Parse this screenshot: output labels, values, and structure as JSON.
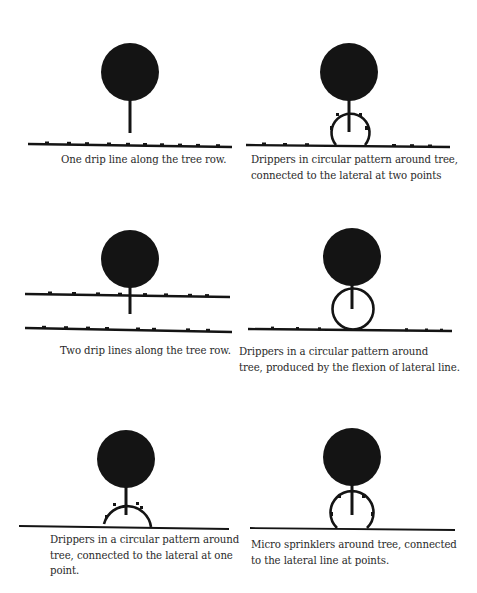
{
  "figure": {
    "colors": {
      "ink": "#141414",
      "caption": "#2a2a2a",
      "background": "#ffffff"
    },
    "panels": [
      {
        "id": "one-drip-line",
        "caption_lines": [
          "One drip line along the tree row."
        ]
      },
      {
        "id": "circular-two-points",
        "caption_lines": [
          "Drippers in circular pattern around tree,",
          "connected to the lateral at two points"
        ]
      },
      {
        "id": "two-drip-lines",
        "caption_lines": [
          "Two drip lines along the tree row."
        ]
      },
      {
        "id": "circular-flexion",
        "caption_lines": [
          "Drippers in a circular pattern around",
          "tree, produced by the flexion of lateral line."
        ]
      },
      {
        "id": "circular-one-point",
        "caption_lines": [
          "Drippers in a circular pattern around",
          "tree, connected to the lateral at one",
          "point."
        ]
      },
      {
        "id": "micro-sprinklers",
        "caption_lines": [
          "Micro sprinklers around tree, connected",
          "to the lateral line at points."
        ]
      }
    ]
  }
}
